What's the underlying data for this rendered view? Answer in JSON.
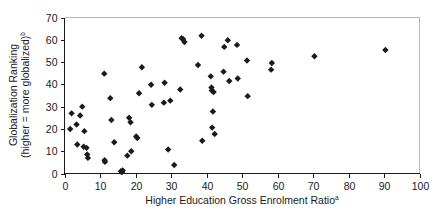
{
  "chart_data": {
    "type": "scatter",
    "title": "",
    "subtitle": "",
    "xlabel": "Higher Education Gross Enrolment Ratio",
    "xlabel_superscript": "a",
    "ylabel_line1": "Globalization Ranking",
    "ylabel_line2": "(higher = more globalized)",
    "ylabel_superscript": "b",
    "xlim": [
      0,
      100
    ],
    "ylim": [
      0,
      70
    ],
    "xticks": [
      0,
      10,
      20,
      30,
      40,
      50,
      60,
      70,
      80,
      90,
      100
    ],
    "yticks": [
      0,
      10,
      20,
      30,
      40,
      50,
      60,
      70
    ],
    "xtick_labels": [
      "0",
      "10",
      "20",
      "30",
      "40",
      "50",
      "60",
      "70",
      "80",
      "90",
      "100"
    ],
    "ytick_labels": [
      "0",
      "10",
      "20",
      "30",
      "40",
      "50",
      "60",
      "70"
    ],
    "grid": false,
    "legend": null,
    "marker": "diamond",
    "marker_color": "#1a1a1a",
    "series": [
      {
        "name": "Countries",
        "points": [
          [
            1.6,
            20.0
          ],
          [
            2.0,
            27.0
          ],
          [
            3.4,
            22.0
          ],
          [
            3.6,
            13.0
          ],
          [
            4.4,
            26.0
          ],
          [
            5.0,
            30.0
          ],
          [
            5.4,
            12.0
          ],
          [
            5.6,
            19.0
          ],
          [
            6.2,
            11.5
          ],
          [
            6.4,
            8.5
          ],
          [
            6.6,
            7.0
          ],
          [
            11.2,
            44.8
          ],
          [
            11.3,
            6.0
          ],
          [
            11.4,
            5.2
          ],
          [
            12.9,
            33.8
          ],
          [
            13.2,
            24.0
          ],
          [
            14.0,
            14.0
          ],
          [
            15.9,
            1.0
          ],
          [
            16.2,
            0.6
          ],
          [
            16.4,
            1.4
          ],
          [
            17.7,
            8.0
          ],
          [
            18.2,
            25.0
          ],
          [
            18.6,
            23.0
          ],
          [
            18.8,
            10.0
          ],
          [
            20.2,
            16.6
          ],
          [
            20.5,
            15.9
          ],
          [
            21.0,
            36.0
          ],
          [
            21.8,
            47.7
          ],
          [
            24.4,
            39.8
          ],
          [
            24.6,
            30.8
          ],
          [
            28.0,
            31.8
          ],
          [
            28.2,
            40.7
          ],
          [
            29.2,
            10.8
          ],
          [
            29.8,
            32.7
          ],
          [
            30.9,
            3.8
          ],
          [
            32.6,
            37.7
          ],
          [
            33.0,
            60.7
          ],
          [
            33.4,
            60.3
          ],
          [
            33.8,
            59.0
          ],
          [
            37.6,
            48.7
          ],
          [
            38.6,
            61.8
          ],
          [
            38.8,
            14.7
          ],
          [
            41.2,
            43.6
          ],
          [
            41.4,
            38.6
          ],
          [
            41.5,
            37.2
          ],
          [
            41.6,
            20.6
          ],
          [
            41.8,
            27.8
          ],
          [
            42.0,
            36.6
          ],
          [
            42.3,
            17.7
          ],
          [
            44.8,
            45.7
          ],
          [
            45.0,
            56.8
          ],
          [
            46.0,
            59.8
          ],
          [
            46.4,
            41.5
          ],
          [
            48.6,
            57.7
          ],
          [
            48.8,
            42.6
          ],
          [
            51.4,
            50.7
          ],
          [
            51.6,
            34.7
          ],
          [
            58.2,
            46.6
          ],
          [
            58.4,
            49.6
          ],
          [
            70.4,
            52.6
          ],
          [
            90.4,
            55.4
          ]
        ]
      }
    ]
  },
  "figure": {
    "background_color": "#ffffff",
    "axis_color": "#1a1a1a",
    "frame_color": "#b9b9b9"
  }
}
